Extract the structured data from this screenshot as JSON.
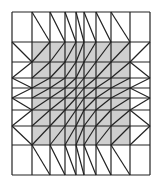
{
  "diagram": {
    "type": "triangulated-mesh",
    "colors": {
      "background": "#ffffff",
      "shade": "#cfcfcf",
      "line": "#222222"
    },
    "x_lines": [
      12,
      32,
      50,
      65,
      76,
      84,
      96,
      111,
      130,
      150
    ],
    "y_lines": [
      12,
      42,
      62,
      78,
      88,
      98,
      110,
      126,
      145,
      175
    ],
    "shaded_region": {
      "x0": 32,
      "y0": 42,
      "x1": 130,
      "y1": 145
    },
    "cell_count": {
      "columns": 9,
      "rows": 9
    }
  }
}
